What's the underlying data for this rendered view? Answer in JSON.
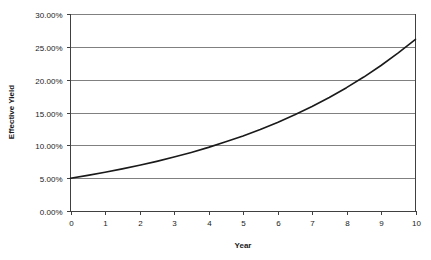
{
  "chart_data": {
    "type": "line",
    "title": "",
    "xlabel": "Year",
    "ylabel": "Effective Yield",
    "xlim": [
      0,
      10
    ],
    "ylim": [
      0,
      0.3
    ],
    "grid": true,
    "legend": false,
    "x_tick_labels": [
      "0",
      "1",
      "2",
      "3",
      "4",
      "5",
      "6",
      "7",
      "8",
      "9",
      "10"
    ],
    "x_tick_values": [
      0,
      1,
      2,
      3,
      4,
      5,
      6,
      7,
      8,
      9,
      10
    ],
    "y_tick_labels": [
      "0.00%",
      "5.00%",
      "10.00%",
      "15.00%",
      "20.00%",
      "25.00%",
      "30.00%"
    ],
    "y_tick_values": [
      0.0,
      0.05,
      0.1,
      0.15,
      0.2,
      0.25,
      0.3
    ],
    "series": [
      {
        "name": "Effective Yield",
        "color": "#1a1a1a",
        "x": [
          0,
          0.5,
          1,
          1.5,
          2,
          2.5,
          3,
          3.5,
          4,
          4.5,
          5,
          5.5,
          6,
          6.5,
          7,
          7.5,
          8,
          8.5,
          9,
          9.5,
          10
        ],
        "values": [
          5.0,
          5.43,
          5.9,
          6.41,
          6.96,
          7.56,
          8.21,
          8.92,
          9.69,
          10.53,
          11.43,
          12.42,
          13.49,
          14.65,
          15.92,
          17.29,
          18.78,
          20.4,
          22.16,
          24.07,
          26.15
        ]
      }
    ],
    "annotations": []
  },
  "axes": {
    "y_title": "Effective Yield",
    "x_title": "Year"
  },
  "colors": {
    "grid": "#808080",
    "frame": "#404040",
    "series": "#1a1a1a",
    "background": "#ffffff"
  }
}
